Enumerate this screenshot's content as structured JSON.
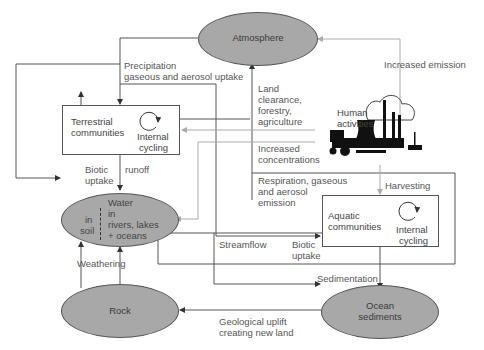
{
  "nodes": {
    "atmosphere": "Atmosphere",
    "terrestrial": {
      "line1": "Terrestrial",
      "line2": "communities"
    },
    "terrestrial_cycle": {
      "line1": "Internal",
      "line2": "cycling"
    },
    "human": {
      "line1": "Human",
      "line2": "activities"
    },
    "water": {
      "title": "Water",
      "soil1": "in",
      "soil2": "soil",
      "riv1": "in",
      "riv2": "rivers, lakes",
      "riv3": "+ oceans"
    },
    "aquatic": {
      "line1": "Aquatic",
      "line2": "communities"
    },
    "aquatic_cycle": {
      "line1": "Internal",
      "line2": "cycling"
    },
    "rock": "Rock",
    "ocean": {
      "line1": "Ocean",
      "line2": "sediments"
    }
  },
  "flows": {
    "precip1": "Precipitation",
    "precip2": "gaseous and aerosol uptake",
    "increased_emission": "Increased emission",
    "land1": "Land",
    "land2": "clearance,",
    "land3": "forestry,",
    "land4": "agriculture",
    "incconc1": "Increased",
    "incconc2": "concentrations",
    "resp1": "Respiration, gaseous",
    "resp2": "and aerosol",
    "resp3": "emission",
    "harvesting": "Harvesting",
    "biotic_uptake_1a": "Biotic",
    "biotic_uptake_1b": "uptake",
    "runoff": "runoff",
    "streamflow": "Streamflow",
    "biotic_uptake_2a": "Biotic",
    "biotic_uptake_2b": "uptake",
    "sedimentation": "Sedimentation",
    "weathering": "Weathering",
    "uplift1": "Geological uplift",
    "uplift2": "creating new land"
  },
  "colors": {
    "ellipse_fill": "#a8a8a8",
    "line": "#555555",
    "grey_line": "#aaaaaa"
  }
}
